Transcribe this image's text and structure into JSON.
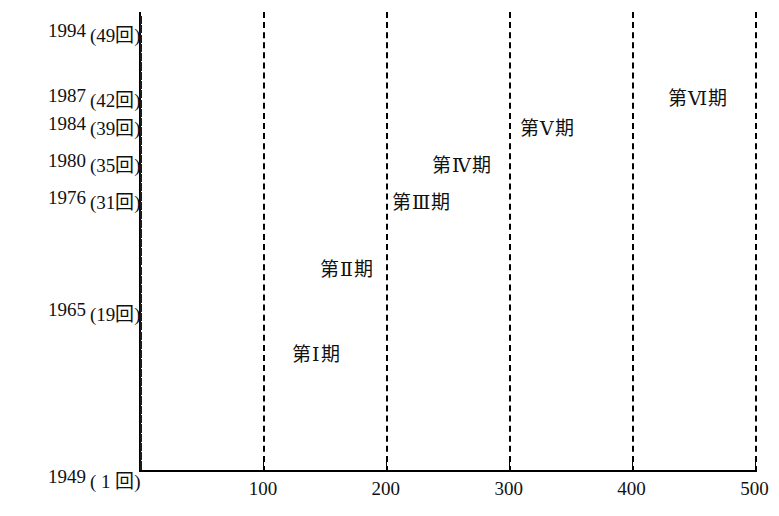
{
  "chart_data": {
    "type": "bar",
    "orientation": "horizontal",
    "title": "",
    "xlabel": "",
    "ylabel": "",
    "xlim": [
      0,
      520
    ],
    "grid": "dashed vertical gridlines at 100, 200, 300, 400, 500",
    "x_ticks": [
      {
        "value": 100,
        "label": "100"
      },
      {
        "value": 200,
        "label": "200"
      },
      {
        "value": 300,
        "label": "300"
      },
      {
        "value": 400,
        "label": "400"
      },
      {
        "value": 500,
        "label": "500"
      }
    ],
    "y_axis_labels": [
      {
        "row": 0,
        "year": "1994",
        "count": "(49回)"
      },
      {
        "row": 7,
        "year": "1987",
        "count": "(42回)"
      },
      {
        "row": 10,
        "year": "1984",
        "count": "(39回)"
      },
      {
        "row": 14,
        "year": "1980",
        "count": "(35回)"
      },
      {
        "row": 18,
        "year": "1976",
        "count": "(31回)"
      },
      {
        "row": 30,
        "year": "1965",
        "count": "(19回)"
      },
      {
        "row": 48,
        "year": "1949",
        "count": "( 1 回)"
      }
    ],
    "phases": [
      {
        "name": "第Ⅰ期",
        "label": "第Ⅰ期"
      },
      {
        "name": "第Ⅱ期",
        "label": "第Ⅱ期"
      },
      {
        "name": "第Ⅲ期",
        "label": "第Ⅲ期"
      },
      {
        "name": "第Ⅳ期",
        "label": "第Ⅳ期"
      },
      {
        "name": "第Ⅴ期",
        "label": "第Ⅴ期"
      },
      {
        "name": "第Ⅵ期",
        "label": "第Ⅵ期"
      }
    ],
    "phase_annotations": [
      {
        "label": "第Ⅵ期",
        "x": 668,
        "y": 96
      },
      {
        "label": "第Ⅴ期",
        "x": 520,
        "y": 126
      },
      {
        "label": "第Ⅳ期",
        "x": 432,
        "y": 163
      },
      {
        "label": "第Ⅲ期",
        "x": 392,
        "y": 200
      },
      {
        "label": "第Ⅱ期",
        "x": 320,
        "y": 267
      },
      {
        "label": "第Ⅰ期",
        "x": 292,
        "y": 352
      }
    ],
    "categories": [
      "1994 (49回)",
      "1993 (48回)",
      "1992 (47回)",
      "1991 (46回)",
      "1990 (45回)",
      "1989 (44回)",
      "1988 (43回)",
      "1987 (42回)",
      "1986 (41回)",
      "1985 (40回)",
      "1984 (39回)",
      "1983 (38回)",
      "1982 (37回)",
      "1981 (36回)",
      "1980 (35回)",
      "1979 (34回)",
      "1978 (33回)",
      "1977 (32回)",
      "1976 (31回)",
      "1975 (30回)",
      "1974 (29回)",
      "1973 (28回)",
      "1972 (27回)",
      "1971 (26回)",
      "1970 (25回)",
      "1969 (24回)",
      "1968 (23回)",
      "1967 (22回)",
      "1966 (21回)",
      "1966 (20回)",
      "1965 (19回)",
      "1964 (18回)",
      "1963 (17回)",
      "1962 (16回)",
      "1961 (15回)",
      "1960 (14回)",
      "1959 (13回)",
      "1958 (12回)",
      "1957 (11回)",
      "1956 (10回)",
      "1955 ( 9回)",
      "1954 ( 8回)",
      "1953 ( 7回)",
      "1952 ( 6回)",
      "1951 ( 5回)",
      "1950 ( 4回)",
      "1950 ( 3回)",
      "1949 ( 2回)",
      "1949 ( 1回)"
    ],
    "values": [
      492,
      505,
      500,
      455,
      428,
      420,
      415,
      372,
      360,
      335,
      292,
      290,
      285,
      272,
      248,
      230,
      228,
      205,
      192,
      185,
      182,
      168,
      158,
      152,
      148,
      138,
      132,
      125,
      112,
      115,
      138,
      108,
      115,
      112,
      132,
      92,
      78,
      58,
      62,
      55,
      78,
      72,
      68,
      72,
      85,
      105,
      72,
      88,
      58
    ],
    "bar_phases": [
      6,
      6,
      6,
      6,
      6,
      6,
      6,
      6,
      6,
      5,
      5,
      5,
      5,
      5,
      4,
      4,
      4,
      4,
      4,
      3,
      3,
      3,
      3,
      3,
      3,
      2,
      2,
      2,
      2,
      2,
      2,
      2,
      2,
      2,
      2,
      1,
      1,
      1,
      1,
      1,
      1,
      1,
      1,
      1,
      1,
      1,
      1,
      1,
      1
    ],
    "colors": {
      "phase_1": "#9d9d9d",
      "phase_2": "#e2e2e2",
      "phase_3": "#a9a9a9",
      "phase_4": "#a9a9a9",
      "phase_5": "#a9a9a9",
      "phase_6": "#a9a9a9",
      "axis": "#000000",
      "background": "#ffffff"
    }
  }
}
